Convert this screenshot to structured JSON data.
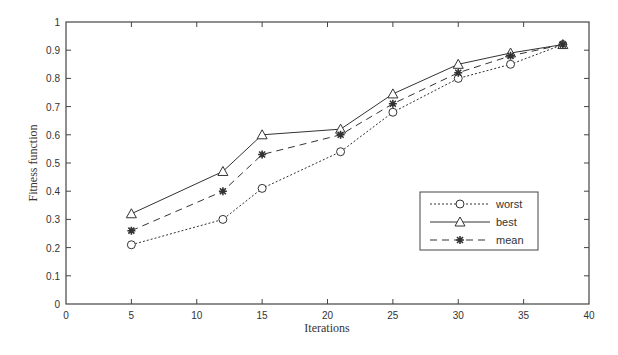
{
  "chart_data": {
    "type": "line",
    "title": "",
    "xlabel": "Iterations",
    "ylabel": "Fitness function",
    "xlim": [
      0,
      40
    ],
    "ylim": [
      0,
      1
    ],
    "xticks": [
      0,
      5,
      10,
      15,
      20,
      25,
      30,
      35,
      40
    ],
    "yticks": [
      0,
      0.1,
      0.2,
      0.3,
      0.4,
      0.5,
      0.6,
      0.7,
      0.8,
      0.9,
      1
    ],
    "ytick_labels": [
      "0",
      "0.1",
      "0.2",
      "0.3",
      "0.4",
      "0.5",
      "0.6",
      "0.7",
      "0.8",
      "0.9",
      "1"
    ],
    "grid": false,
    "legend_position": "lower right",
    "x": [
      5,
      12,
      15,
      21,
      25,
      30,
      34,
      38
    ],
    "series": [
      {
        "name": "worst",
        "marker": "circle",
        "line": "dotted",
        "values": [
          0.21,
          0.3,
          0.41,
          0.54,
          0.68,
          0.8,
          0.85,
          0.92
        ]
      },
      {
        "name": "best",
        "marker": "triangle",
        "line": "solid",
        "values": [
          0.32,
          0.47,
          0.6,
          0.62,
          0.745,
          0.85,
          0.89,
          0.92
        ]
      },
      {
        "name": "mean",
        "marker": "star",
        "line": "dashed",
        "values": [
          0.26,
          0.4,
          0.53,
          0.6,
          0.71,
          0.82,
          0.88,
          0.92
        ]
      }
    ],
    "colors": {
      "line": "#333333",
      "axis": "#444444"
    }
  }
}
